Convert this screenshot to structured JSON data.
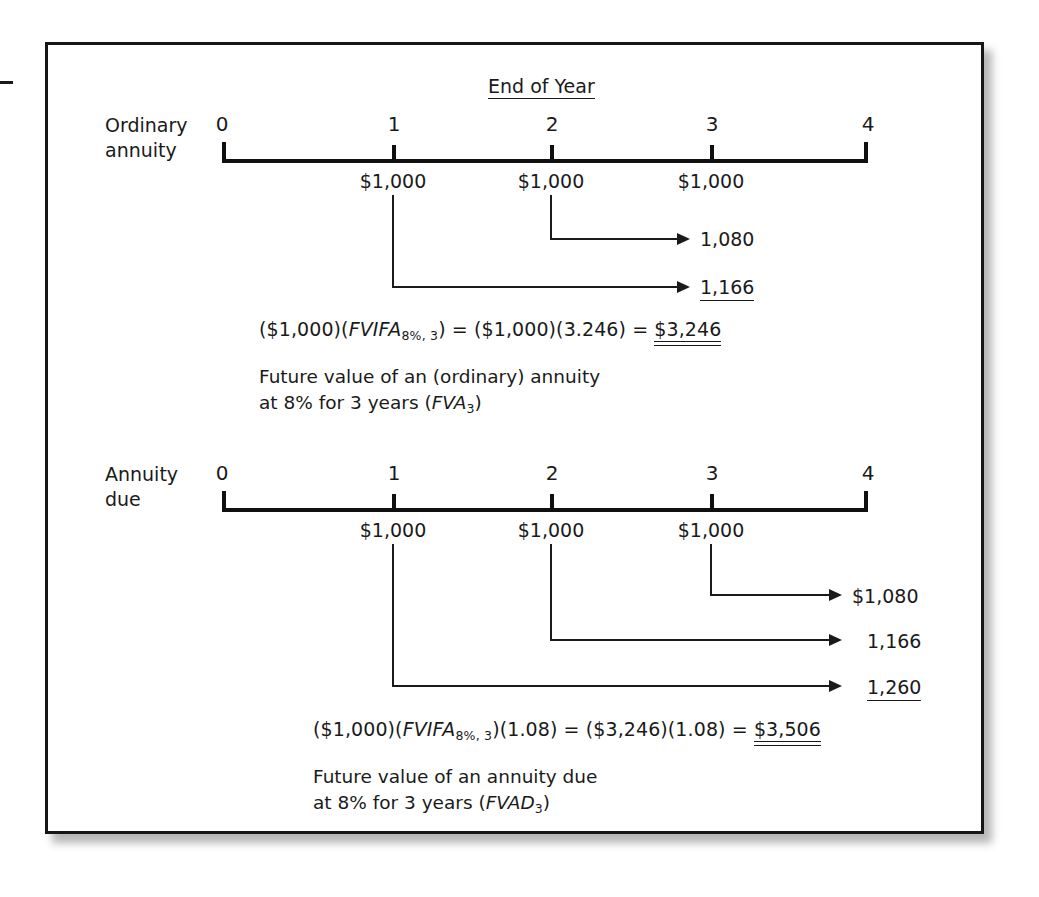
{
  "figure": {
    "header": "End of Year",
    "axis_labels": [
      "0",
      "1",
      "2",
      "3",
      "4"
    ]
  },
  "sections": [
    {
      "id": "ordinary-annuity",
      "title_line1": "Ordinary",
      "title_line2": "annuity",
      "cash_flows": [
        "$1,000",
        "$1,000",
        "$1,000"
      ],
      "compounded_values": [
        "1,080",
        "1,166"
      ],
      "formula": {
        "prefix": "($1,000)(",
        "factor": "FVIFA",
        "subscript": "8%, 3",
        "middle": ") = ($1,000)(3.246) = ",
        "result": "$3,246"
      },
      "description_line1": "Future value of an (ordinary) annuity",
      "description_line2_pre": "at 8% for 3 years (",
      "description_line2_sym": "FVA",
      "description_line2_sub": "3",
      "description_line2_post": ")"
    },
    {
      "id": "annuity-due",
      "title_line1": "Annuity",
      "title_line2": "due",
      "cash_flows": [
        "$1,000",
        "$1,000",
        "$1,000"
      ],
      "compounded_values": [
        "$1,080",
        "1,166",
        "1,260"
      ],
      "formula": {
        "prefix": "($1,000)(",
        "factor": "FVIFA",
        "subscript": "8%, 3",
        "middle": ")(1.08) = ($3,246)(1.08) = ",
        "result": "$3,506"
      },
      "description_line1": "Future value of an annuity due",
      "description_line2_pre": "at 8% for 3 years (",
      "description_line2_sym": "FVAD",
      "description_line2_sub": "3",
      "description_line2_post": ")"
    }
  ],
  "colors": {
    "ink": "#1a1a1a",
    "rule": "#101010",
    "background": "#ffffff"
  }
}
